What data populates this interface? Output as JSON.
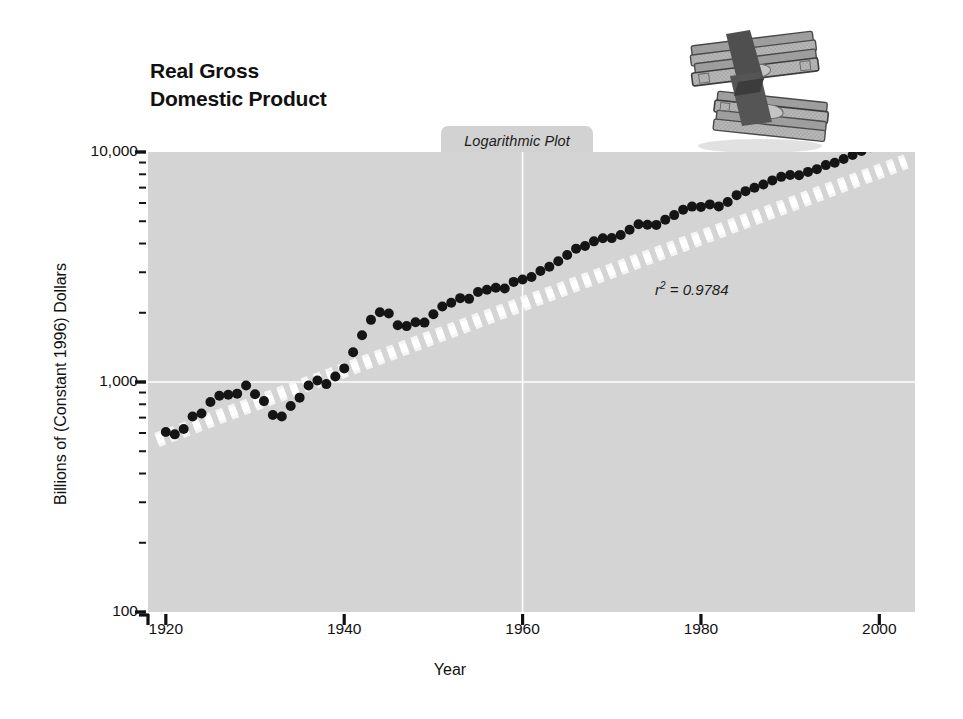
{
  "figure": {
    "title": "Real Gross\nDomestic Product",
    "plot_type_tab": "Logarithmic Plot",
    "annotation": {
      "symbol": "r",
      "exponent": "2",
      "equals_value": "= 0.9784",
      "full": "r2 = 0.9784"
    },
    "illustration": "stack-of-money-icon",
    "background_color": "#ffffff",
    "plot_background_color": "#d4d4d4",
    "gridline_color": "#ffffff",
    "marker_color": "#151515",
    "trendline_color": "#f7f7f7"
  },
  "chart_data": {
    "type": "scatter",
    "title": "Real Gross Domestic Product",
    "subtitle": "Logarithmic Plot",
    "xlabel": "Year",
    "ylabel": "Billions of (Constant 1996) Dollars",
    "yscale": "log",
    "xlim": [
      1918,
      2004
    ],
    "ylim": [
      100,
      10000
    ],
    "xticks": [
      1920,
      1940,
      1960,
      1980,
      2000
    ],
    "xtick_labels": [
      "1920",
      "1940",
      "1960",
      "1980",
      "2000"
    ],
    "yticks": [
      100,
      1000,
      10000
    ],
    "ytick_labels": [
      "100",
      "1,000",
      "10,000"
    ],
    "yminor_ticks": [
      200,
      300,
      400,
      500,
      600,
      700,
      800,
      900,
      2000,
      3000,
      4000,
      5000,
      6000,
      7000,
      8000,
      9000
    ],
    "grid": true,
    "gridlines": {
      "horizontal": [
        1000
      ],
      "vertical": [
        1960
      ]
    },
    "legend": null,
    "annotations": [
      {
        "text": "r2 = 0.9784",
        "x": 1972,
        "y": 2700
      }
    ],
    "series": [
      {
        "name": "Real GDP",
        "marker": "filled-circle",
        "x": [
          1920,
          1921,
          1922,
          1923,
          1924,
          1925,
          1926,
          1927,
          1928,
          1929,
          1930,
          1931,
          1932,
          1933,
          1934,
          1935,
          1936,
          1937,
          1938,
          1939,
          1940,
          1941,
          1942,
          1943,
          1944,
          1945,
          1946,
          1947,
          1948,
          1949,
          1950,
          1951,
          1952,
          1953,
          1954,
          1955,
          1956,
          1957,
          1958,
          1959,
          1960,
          1961,
          1962,
          1963,
          1964,
          1965,
          1966,
          1967,
          1968,
          1969,
          1970,
          1971,
          1972,
          1973,
          1974,
          1975,
          1976,
          1977,
          1978,
          1979,
          1980,
          1981,
          1982,
          1983,
          1984,
          1985,
          1986,
          1987,
          1988,
          1989,
          1990,
          1991,
          1992,
          1993,
          1994,
          1995,
          1996,
          1997,
          1998,
          1999,
          2000,
          2001,
          2002
        ],
        "y": [
          606,
          592,
          625,
          708,
          730,
          818,
          872,
          880,
          890,
          966,
          884,
          826,
          719,
          708,
          786,
          855,
          966,
          1016,
          979,
          1057,
          1146,
          1346,
          1598,
          1863,
          2012,
          1987,
          1765,
          1750,
          1820,
          1812,
          1970,
          2129,
          2209,
          2315,
          2299,
          2462,
          2518,
          2570,
          2548,
          2724,
          2790,
          2862,
          3036,
          3168,
          3351,
          3567,
          3800,
          3901,
          4088,
          4215,
          4223,
          4360,
          4590,
          4850,
          4828,
          4821,
          5081,
          5316,
          5614,
          5788,
          5773,
          5919,
          5801,
          6059,
          6492,
          6759,
          6993,
          7227,
          7526,
          7796,
          7938,
          7925,
          8195,
          8422,
          8771,
          8974,
          9318,
          9700,
          10100,
          10500,
          10900,
          11000,
          11200
        ],
        "y_display_note": "plotted in billions of constant 1996 dollars"
      }
    ],
    "trendline": {
      "type": "exponential-fit",
      "style": "thick white dashed band",
      "r_squared": 0.9784,
      "start": {
        "x": 1919,
        "y": 560
      },
      "end": {
        "x": 2003,
        "y": 9100
      }
    }
  }
}
